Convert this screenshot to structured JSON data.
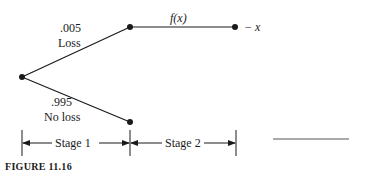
{
  "figure": {
    "caption": "FIGURE 11.16",
    "branches": {
      "loss": {
        "probability": ".005",
        "label": "Loss"
      },
      "no_loss": {
        "probability": ".995",
        "label": "No loss"
      }
    },
    "stage2_payoff_label": "f(x)",
    "terminal_label": "− x",
    "stages": [
      {
        "label": "Stage 1"
      },
      {
        "label": "Stage 2"
      }
    ]
  },
  "colors": {
    "ink": "#1a1a1a",
    "background": "#ffffff"
  }
}
